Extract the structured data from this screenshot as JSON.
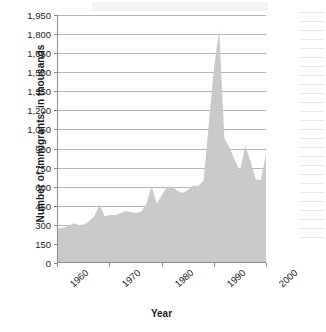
{
  "chart_data": {
    "type": "area",
    "title": "",
    "xlabel": "Year",
    "ylabel": "Number of immigrants, in thousands",
    "xlim": [
      1960,
      2000
    ],
    "ylim": [
      0,
      1950
    ],
    "grid": true,
    "legend": "none",
    "fill_color": "#c9c9c9",
    "gridline_color": "#b4b4b4",
    "axis_color": "#8a8a8a",
    "y_ticks": [
      0,
      150,
      300,
      450,
      600,
      750,
      900,
      1050,
      1200,
      1350,
      1500,
      1650,
      1800,
      1950
    ],
    "y_tick_labels": [
      "0",
      "150",
      "300",
      "450",
      "600",
      "750",
      "900",
      "1,050",
      "1,200",
      "1,350",
      "1,500",
      "1,650",
      "1,800",
      "1,950"
    ],
    "x_ticks": [
      1960,
      1970,
      1980,
      1990,
      2000
    ],
    "x_tick_labels": [
      "1960",
      "1970",
      "1980",
      "1990",
      "2000"
    ],
    "x": [
      1960,
      1961,
      1962,
      1963,
      1964,
      1965,
      1966,
      1967,
      1968,
      1969,
      1970,
      1971,
      1972,
      1973,
      1974,
      1975,
      1976,
      1977,
      1978,
      1979,
      1980,
      1981,
      1982,
      1983,
      1984,
      1985,
      1986,
      1987,
      1988,
      1989,
      1990,
      1991,
      1992,
      1993,
      1994,
      1995,
      1996,
      1997,
      1998,
      1999,
      2000
    ],
    "values": [
      265,
      271,
      284,
      306,
      292,
      297,
      323,
      362,
      454,
      359,
      373,
      370,
      385,
      400,
      395,
      386,
      399,
      462,
      601,
      460,
      531,
      597,
      594,
      560,
      544,
      570,
      602,
      602,
      643,
      1091,
      1536,
      1827,
      974,
      904,
      804,
      720,
      916,
      798,
      654,
      647,
      850
    ]
  }
}
